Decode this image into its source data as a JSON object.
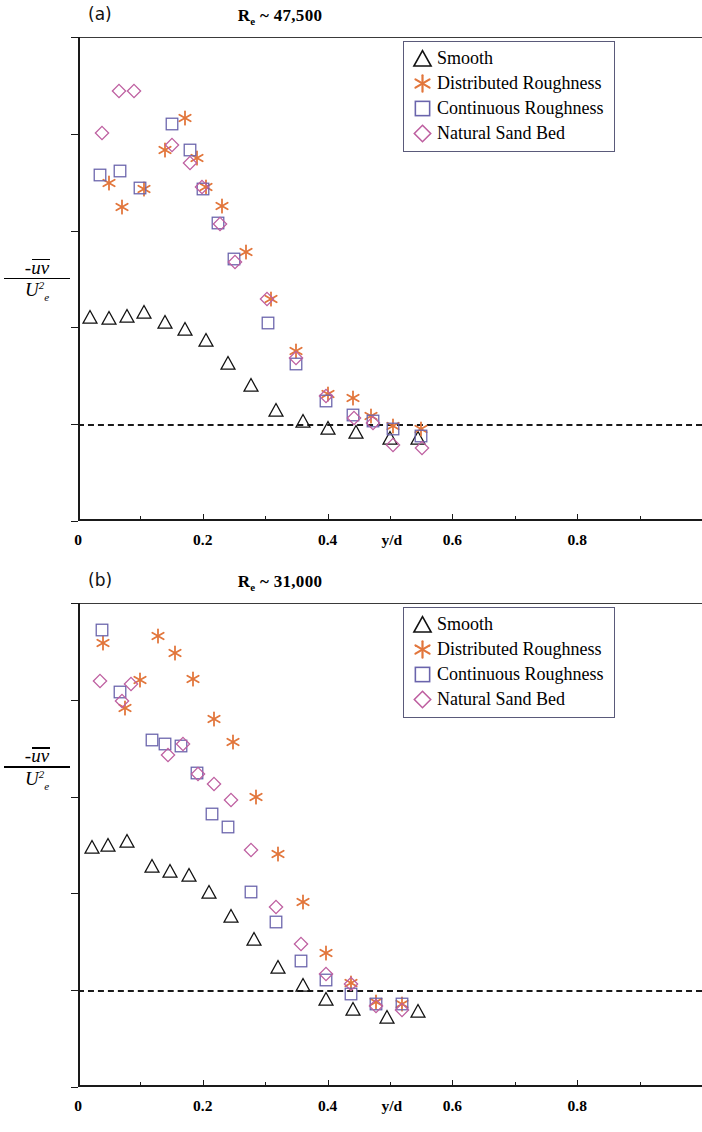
{
  "figure": {
    "y_axis_label": {
      "numerator": "-uv",
      "denominator_base": "U",
      "denominator_sub": "e",
      "denominator_sup": "2"
    },
    "x_axis_label": "y/d"
  },
  "colors": {
    "smooth": "#111111",
    "distributed": "#E2763C",
    "continuous": "#6A64AC",
    "natural": "#BE5FA0",
    "axis": "#1a1a1a",
    "legend_border": "#5a5a7a"
  },
  "legend": {
    "items": [
      {
        "label": "Smooth",
        "marker": "triangle-marker",
        "color_key": "smooth"
      },
      {
        "label": "Distributed Roughness",
        "marker": "asterisk-marker",
        "color_key": "distributed"
      },
      {
        "label": "Continuous Roughness",
        "marker": "square-marker",
        "color_key": "continuous"
      },
      {
        "label": "Natural Sand Bed",
        "marker": "diamond-marker",
        "color_key": "natural"
      }
    ]
  },
  "panels": [
    {
      "tag": "(a)",
      "title_prefix": "R",
      "title_sub": "e",
      "title_rest": " ~ 47,500"
    },
    {
      "tag": "(b)",
      "title_prefix": "R",
      "title_sub": "e",
      "title_rest": " ~ 31,000"
    }
  ],
  "chart_data": [
    {
      "type": "scatter",
      "panel": "(a)",
      "title": "Re ~ 47,500",
      "xlabel": "y/d",
      "ylabel": "-uv / Ue^2",
      "xlim": [
        0,
        1.0
      ],
      "ylim": [
        -0.001,
        0.004
      ],
      "xticks": [
        0,
        0.2,
        0.4,
        0.6,
        0.8
      ],
      "xtick_labels": [
        "0",
        "0.2",
        "0.4",
        "0.6",
        "0.8"
      ],
      "yticks": [
        -0.001,
        0,
        0.001,
        0.002,
        0.003,
        0.004
      ],
      "ytick_labels": [
        "-0.001",
        "0",
        "0.001",
        "0.002",
        "0.003",
        "0.004"
      ],
      "grid": false,
      "zero_reference_line": 0,
      "legend_position": "top-right",
      "series": [
        {
          "name": "Smooth",
          "marker": "triangle",
          "color": "#111111",
          "points": [
            [
              0.02,
              0.00111
            ],
            [
              0.05,
              0.0011
            ],
            [
              0.078,
              0.00112
            ],
            [
              0.105,
              0.00116
            ],
            [
              0.14,
              0.00106
            ],
            [
              0.172,
              0.00098
            ],
            [
              0.205,
              0.00087
            ],
            [
              0.24,
              0.00063
            ],
            [
              0.278,
              0.0004
            ],
            [
              0.318,
              0.00015
            ],
            [
              0.36,
              3e-05
            ],
            [
              0.4,
              -4e-05
            ],
            [
              0.445,
              -8e-05
            ],
            [
              0.5,
              -0.00014
            ],
            [
              0.545,
              -0.00014
            ]
          ]
        },
        {
          "name": "Distributed Roughness",
          "marker": "asterisk",
          "color": "#E2763C",
          "points": [
            [
              0.05,
              0.00249
            ],
            [
              0.07,
              0.00224
            ],
            [
              0.105,
              0.00243
            ],
            [
              0.14,
              0.00283
            ],
            [
              0.172,
              0.00316
            ],
            [
              0.19,
              0.00275
            ],
            [
              0.205,
              0.00245
            ],
            [
              0.23,
              0.00225
            ],
            [
              0.27,
              0.00178
            ],
            [
              0.31,
              0.00129
            ],
            [
              0.35,
              0.00076
            ],
            [
              0.4,
              0.00031
            ],
            [
              0.44,
              0.00027
            ],
            [
              0.47,
              8e-05
            ],
            [
              0.505,
              -2e-05
            ],
            [
              0.55,
              -5e-05
            ]
          ]
        },
        {
          "name": "Continuous Roughness",
          "marker": "square",
          "color": "#6A64AC",
          "points": [
            [
              0.035,
              0.00257
            ],
            [
              0.068,
              0.00262
            ],
            [
              0.1,
              0.00244
            ],
            [
              0.15,
              0.0031
            ],
            [
              0.18,
              0.00283
            ],
            [
              0.2,
              0.00243
            ],
            [
              0.225,
              0.00208
            ],
            [
              0.25,
              0.00171
            ],
            [
              0.305,
              0.00105
            ],
            [
              0.35,
              0.00062
            ],
            [
              0.398,
              0.00024
            ],
            [
              0.44,
              0.0001
            ],
            [
              0.472,
              3e-05
            ],
            [
              0.505,
              -5e-05
            ],
            [
              0.55,
              -0.00012
            ]
          ]
        },
        {
          "name": "Natural Sand Bed",
          "marker": "diamond",
          "color": "#BE5FA0",
          "points": [
            [
              0.038,
              0.00301
            ],
            [
              0.065,
              0.00344
            ],
            [
              0.09,
              0.00344
            ],
            [
              0.15,
              0.00288
            ],
            [
              0.18,
              0.0027
            ],
            [
              0.198,
              0.00245
            ],
            [
              0.228,
              0.00207
            ],
            [
              0.252,
              0.00168
            ],
            [
              0.303,
              0.00129
            ],
            [
              0.35,
              0.00068
            ],
            [
              0.398,
              0.00029
            ],
            [
              0.443,
              6e-05
            ],
            [
              0.472,
              1e-05
            ],
            [
              0.505,
              -0.00021
            ],
            [
              0.552,
              -0.00025
            ]
          ]
        }
      ]
    },
    {
      "type": "scatter",
      "panel": "(b)",
      "title": "Re ~ 31,000",
      "xlabel": "y/d",
      "ylabel": "-uv / Ue^2",
      "xlim": [
        0,
        1.0
      ],
      "ylim": [
        -0.001,
        0.004
      ],
      "xticks": [
        0,
        0.2,
        0.4,
        0.6,
        0.8
      ],
      "xtick_labels": [
        "0",
        "0.2",
        "0.4",
        "0.6",
        "0.8"
      ],
      "yticks": [
        -0.001,
        0,
        0.001,
        0.002,
        0.003,
        0.004
      ],
      "ytick_labels": [
        "-0.001",
        "0",
        "0.001",
        "0.002",
        "0.003",
        "0.004"
      ],
      "grid": false,
      "zero_reference_line": 0,
      "legend_position": "top-right",
      "series": [
        {
          "name": "Smooth",
          "marker": "triangle",
          "color": "#111111",
          "points": [
            [
              0.022,
              0.00148
            ],
            [
              0.048,
              0.0015
            ],
            [
              0.078,
              0.00154
            ],
            [
              0.118,
              0.00128
            ],
            [
              0.148,
              0.00123
            ],
            [
              0.178,
              0.00119
            ],
            [
              0.21,
              0.00101
            ],
            [
              0.245,
              0.00077
            ],
            [
              0.282,
              0.00053
            ],
            [
              0.32,
              0.00024
            ],
            [
              0.36,
              5e-05
            ],
            [
              0.398,
              -9e-05
            ],
            [
              0.44,
              -0.00019
            ],
            [
              0.495,
              -0.00028
            ],
            [
              0.545,
              -0.00022
            ]
          ]
        },
        {
          "name": "Distributed Roughness",
          "marker": "asterisk",
          "color": "#E2763C",
          "points": [
            [
              0.04,
              0.00359
            ],
            [
              0.075,
              0.00292
            ],
            [
              0.1,
              0.0032
            ],
            [
              0.128,
              0.00366
            ],
            [
              0.155,
              0.00348
            ],
            [
              0.185,
              0.00322
            ],
            [
              0.218,
              0.0028
            ],
            [
              0.248,
              0.00256
            ],
            [
              0.285,
              0.002
            ],
            [
              0.32,
              0.00141
            ],
            [
              0.36,
              0.00091
            ],
            [
              0.398,
              0.00038
            ],
            [
              0.438,
              7e-05
            ],
            [
              0.478,
              -0.00012
            ],
            [
              0.52,
              -0.00014
            ]
          ]
        },
        {
          "name": "Continuous Roughness",
          "marker": "square",
          "color": "#6A64AC",
          "points": [
            [
              0.038,
              0.00372
            ],
            [
              0.068,
              0.00308
            ],
            [
              0.118,
              0.00258
            ],
            [
              0.14,
              0.00254
            ],
            [
              0.165,
              0.00252
            ],
            [
              0.19,
              0.00224
            ],
            [
              0.215,
              0.00182
            ],
            [
              0.24,
              0.00169
            ],
            [
              0.278,
              0.00101
            ],
            [
              0.318,
              0.0007
            ],
            [
              0.358,
              0.0003
            ],
            [
              0.398,
              0.00011
            ],
            [
              0.438,
              -4e-05
            ],
            [
              0.478,
              -0.00014
            ],
            [
              0.52,
              -0.00014
            ]
          ]
        },
        {
          "name": "Natural Sand Bed",
          "marker": "diamond",
          "color": "#BE5FA0",
          "points": [
            [
              0.035,
              0.00319
            ],
            [
              0.07,
              0.00299
            ],
            [
              0.085,
              0.00316
            ],
            [
              0.145,
              0.00243
            ],
            [
              0.168,
              0.00254
            ],
            [
              0.192,
              0.00223
            ],
            [
              0.218,
              0.00213
            ],
            [
              0.245,
              0.00197
            ],
            [
              0.278,
              0.00145
            ],
            [
              0.318,
              0.00086
            ],
            [
              0.358,
              0.00048
            ],
            [
              0.397,
              0.00017
            ],
            [
              0.437,
              6e-05
            ],
            [
              0.478,
              -0.00016
            ],
            [
              0.52,
              -0.0002
            ]
          ]
        }
      ]
    }
  ]
}
